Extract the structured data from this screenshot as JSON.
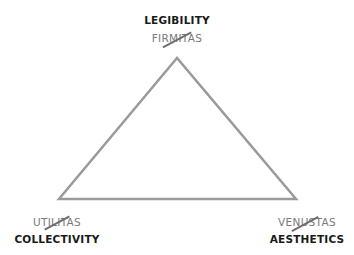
{
  "diagram": {
    "type": "triangle",
    "line_color": "#9a9a9a",
    "vertices": {
      "top": {
        "new_term": "LEGIBILITY",
        "old_term": "FIRMITAS",
        "old_struck": true
      },
      "bottom_left": {
        "old_term": "UTILITAS",
        "old_struck": true,
        "new_term": "COLLECTIVITY"
      },
      "bottom_right": {
        "old_term": "VENUSTAS",
        "old_struck": true,
        "new_term": "AESTHETICS"
      }
    }
  }
}
